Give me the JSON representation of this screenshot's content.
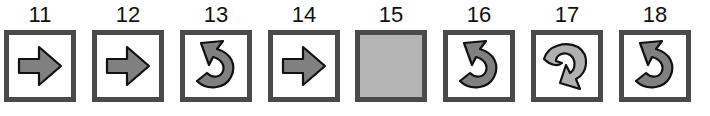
{
  "sequence": {
    "items": [
      {
        "number": "11",
        "icon": "right-arrow",
        "fill": "#808080"
      },
      {
        "number": "12",
        "icon": "right-arrow",
        "fill": "#808080"
      },
      {
        "number": "13",
        "icon": "counterclockwise-curl-arrow",
        "fill": "#808080"
      },
      {
        "number": "14",
        "icon": "right-arrow",
        "fill": "#808080"
      },
      {
        "number": "15",
        "icon": "blank-gray-square",
        "fill": "#b4b4b4"
      },
      {
        "number": "16",
        "icon": "counterclockwise-curl-arrow",
        "fill": "#808080"
      },
      {
        "number": "17",
        "icon": "clockwise-curl-arrow",
        "fill": "#b0b0b0"
      },
      {
        "number": "18",
        "icon": "counterclockwise-curl-arrow",
        "fill": "#808080"
      }
    ]
  },
  "colors": {
    "border": "#4a4a4a",
    "arrow_dark": "#808080",
    "arrow_light": "#b0b0b0",
    "blank_fill": "#b4b4b4"
  }
}
